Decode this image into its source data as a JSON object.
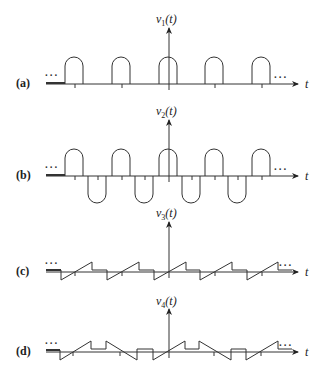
{
  "panels": [
    {
      "id": "a",
      "label": "(a)",
      "ylabel_var": "v",
      "ylabel_sub": "1",
      "ylabel_arg": "(t)",
      "xlabel": "t",
      "continuation": "...",
      "waveform": "half-rounded positive pulse train"
    },
    {
      "id": "b",
      "label": "(b)",
      "ylabel_var": "v",
      "ylabel_sub": "2",
      "ylabel_arg": "(t)",
      "xlabel": "t",
      "continuation": "...",
      "waveform": "alternating positive/negative rounded pulse train"
    },
    {
      "id": "c",
      "label": "(c)",
      "ylabel_var": "v",
      "ylabel_sub": "3",
      "ylabel_arg": "(t)",
      "xlabel": "t",
      "continuation": "...",
      "waveform": "sawtooth ramp with flat segments"
    },
    {
      "id": "d",
      "label": "(d)",
      "ylabel_var": "v",
      "ylabel_sub": "4",
      "ylabel_arg": "(t)",
      "xlabel": "t",
      "continuation": "...",
      "waveform": "alternating rising/falling ramps with flat segments"
    }
  ],
  "colors": {
    "stroke": "#333333",
    "background": "#ffffff"
  }
}
